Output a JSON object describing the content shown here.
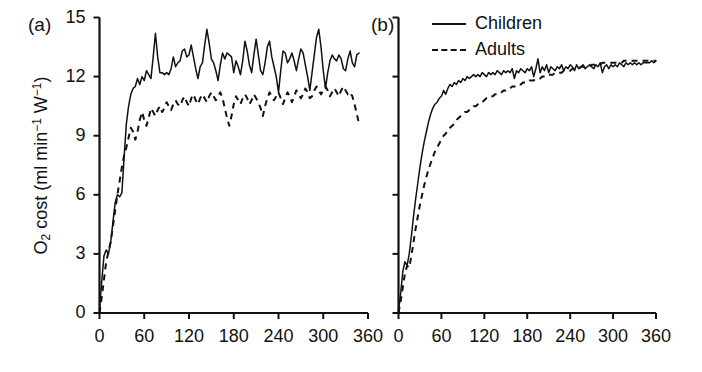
{
  "figure": {
    "ylabel_parts": {
      "lead": "O",
      "sub": "2",
      "mid": " cost (ml min",
      "sup1": "−1",
      "mid2": " W",
      "sup2": "−1",
      "tail": ")"
    },
    "ylabel_plain": "O2 cost (ml min-1 W-1)"
  },
  "panels": {
    "a": {
      "label": "(a)"
    },
    "b": {
      "label": "(b)"
    }
  },
  "legend": {
    "position": "top-right of panel b",
    "items": [
      {
        "label": "Children",
        "style": "solid",
        "swatch": "solid-line-swatch"
      },
      {
        "label": "Adults",
        "style": "dashed",
        "swatch": "dashed-line-swatch"
      }
    ]
  },
  "chart_data": [
    {
      "id": "panel-a",
      "type": "line",
      "title": "(a)",
      "xlabel": "",
      "ylabel": "O2 cost (ml min-1 W-1)",
      "xlim": [
        0,
        360
      ],
      "ylim": [
        0,
        15
      ],
      "xticks": [
        0,
        60,
        120,
        180,
        240,
        300,
        360
      ],
      "yticks": [
        0,
        3,
        6,
        9,
        12,
        15
      ],
      "xticklabels": [
        "0",
        "60",
        "120",
        "180",
        "240",
        "300",
        "360"
      ],
      "yticklabels": [
        "0",
        "3",
        "6",
        "9",
        "12",
        "15"
      ],
      "grid": false,
      "legend": false,
      "series": [
        {
          "name": "Children",
          "style": "solid",
          "x": [
            0,
            3,
            6,
            9,
            12,
            15,
            18,
            21,
            24,
            27,
            30,
            33,
            36,
            39,
            42,
            45,
            48,
            51,
            54,
            57,
            60,
            63,
            66,
            69,
            72,
            75,
            78,
            81,
            84,
            87,
            90,
            93,
            96,
            99,
            102,
            105,
            108,
            111,
            114,
            117,
            120,
            123,
            126,
            129,
            132,
            135,
            138,
            141,
            144,
            147,
            150,
            153,
            156,
            159,
            162,
            165,
            168,
            171,
            174,
            177,
            180,
            183,
            186,
            189,
            192,
            195,
            198,
            201,
            204,
            207,
            210,
            213,
            216,
            219,
            222,
            225,
            228,
            231,
            234,
            237,
            240,
            243,
            246,
            249,
            252,
            255,
            258,
            261,
            264,
            267,
            270,
            273,
            276,
            279,
            282,
            285,
            288,
            291,
            294,
            297,
            300,
            303,
            306,
            309,
            312,
            315,
            318,
            321,
            324,
            327,
            330,
            333,
            336,
            339,
            342,
            345,
            348
          ],
          "y": [
            0.2,
            1.6,
            2.9,
            3.2,
            3.0,
            3.6,
            4.6,
            5.6,
            6.0,
            5.9,
            6.1,
            7.9,
            9.6,
            10.5,
            11.1,
            11.4,
            11.5,
            11.9,
            11.6,
            12.0,
            11.8,
            12.3,
            12.1,
            11.9,
            13.0,
            14.2,
            13.0,
            12.2,
            12.2,
            12.1,
            12.2,
            12.1,
            12.4,
            13.0,
            12.5,
            12.7,
            12.8,
            13.3,
            13.4,
            13.0,
            13.1,
            13.6,
            13.0,
            12.4,
            11.9,
            12.5,
            12.7,
            13.6,
            14.4,
            13.7,
            12.9,
            12.7,
            12.3,
            11.8,
            12.6,
            13.2,
            12.9,
            13.2,
            13.1,
            13.0,
            12.2,
            12.8,
            12.5,
            12.1,
            12.8,
            13.8,
            13.3,
            12.6,
            12.2,
            13.1,
            13.9,
            13.1,
            12.3,
            12.1,
            12.7,
            13.5,
            13.8,
            13.0,
            12.5,
            12.0,
            11.2,
            12.3,
            13.3,
            13.2,
            12.7,
            12.9,
            13.2,
            12.8,
            12.3,
            12.9,
            13.4,
            13.2,
            12.6,
            12.0,
            11.3,
            12.2,
            13.1,
            14.0,
            14.4,
            13.5,
            12.3,
            11.4,
            12.2,
            12.8,
            13.1,
            12.9,
            12.8,
            13.1,
            12.9,
            12.4,
            12.3,
            12.9,
            13.3,
            12.7,
            12.5,
            13.1,
            13.2
          ]
        },
        {
          "name": "Adults",
          "style": "dashed",
          "x": [
            0,
            3,
            6,
            9,
            12,
            15,
            18,
            21,
            24,
            27,
            30,
            33,
            36,
            39,
            42,
            45,
            48,
            51,
            54,
            57,
            60,
            63,
            66,
            69,
            72,
            75,
            78,
            81,
            84,
            87,
            90,
            93,
            96,
            99,
            102,
            105,
            108,
            111,
            114,
            117,
            120,
            123,
            126,
            129,
            132,
            135,
            138,
            141,
            144,
            147,
            150,
            153,
            156,
            159,
            162,
            165,
            168,
            171,
            174,
            177,
            180,
            183,
            186,
            189,
            192,
            195,
            198,
            201,
            204,
            207,
            210,
            213,
            216,
            219,
            222,
            225,
            228,
            231,
            234,
            237,
            240,
            243,
            246,
            249,
            252,
            255,
            258,
            261,
            264,
            267,
            270,
            273,
            276,
            279,
            282,
            285,
            288,
            291,
            294,
            297,
            300,
            303,
            306,
            309,
            312,
            315,
            318,
            321,
            324,
            327,
            330,
            333,
            336,
            339,
            342,
            345,
            348
          ],
          "y": [
            0.0,
            0.8,
            1.7,
            2.6,
            3.1,
            3.6,
            4.4,
            5.2,
            6.0,
            6.7,
            7.4,
            8.0,
            8.4,
            8.9,
            9.4,
            9.2,
            8.8,
            9.2,
            9.8,
            10.2,
            9.8,
            9.5,
            9.9,
            10.4,
            10.2,
            10.0,
            10.3,
            10.5,
            10.2,
            10.4,
            10.7,
            10.5,
            10.3,
            10.6,
            10.8,
            10.6,
            10.5,
            10.8,
            11.0,
            10.7,
            10.5,
            10.9,
            11.1,
            10.8,
            10.6,
            10.9,
            11.1,
            10.9,
            10.7,
            11.0,
            11.2,
            11.0,
            10.8,
            11.0,
            11.2,
            10.9,
            10.4,
            9.9,
            9.5,
            10.0,
            10.6,
            11.0,
            10.8,
            10.6,
            10.9,
            11.1,
            10.9,
            10.6,
            10.8,
            11.1,
            10.9,
            10.7,
            10.4,
            10.0,
            10.5,
            10.9,
            11.2,
            11.0,
            10.8,
            11.0,
            11.2,
            10.9,
            10.6,
            10.9,
            11.2,
            11.0,
            10.7,
            11.0,
            11.3,
            11.1,
            10.9,
            11.1,
            11.4,
            11.2,
            10.9,
            11.0,
            11.3,
            11.5,
            11.3,
            11.1,
            11.3,
            11.5,
            11.3,
            11.0,
            11.2,
            11.4,
            11.2,
            11.0,
            11.3,
            11.5,
            11.3,
            11.1,
            11.2,
            11.0,
            10.6,
            10.1,
            9.6
          ]
        }
      ]
    },
    {
      "id": "panel-b",
      "type": "line",
      "title": "(b)",
      "xlabel": "",
      "ylabel": "O2 cost (ml min-1 W-1)",
      "xlim": [
        0,
        360
      ],
      "ylim": [
        0,
        15
      ],
      "xticks": [
        0,
        60,
        120,
        180,
        240,
        300,
        360
      ],
      "yticks": [
        0,
        3,
        6,
        9,
        12,
        15
      ],
      "xticklabels": [
        "0",
        "60",
        "120",
        "180",
        "240",
        "300",
        "360"
      ],
      "yticklabels": [],
      "grid": false,
      "legend": true,
      "series": [
        {
          "name": "Children",
          "style": "solid",
          "x": [
            0,
            3,
            6,
            9,
            12,
            15,
            18,
            21,
            24,
            27,
            30,
            33,
            36,
            39,
            42,
            45,
            48,
            51,
            54,
            57,
            60,
            63,
            66,
            69,
            72,
            75,
            78,
            81,
            84,
            87,
            90,
            93,
            96,
            99,
            102,
            105,
            108,
            111,
            114,
            117,
            120,
            123,
            126,
            129,
            132,
            135,
            138,
            141,
            144,
            147,
            150,
            153,
            156,
            159,
            162,
            165,
            168,
            171,
            174,
            177,
            180,
            183,
            186,
            189,
            192,
            195,
            198,
            201,
            204,
            207,
            210,
            213,
            216,
            219,
            222,
            225,
            228,
            231,
            234,
            237,
            240,
            243,
            246,
            249,
            252,
            255,
            258,
            261,
            264,
            267,
            270,
            273,
            276,
            279,
            282,
            285,
            288,
            291,
            294,
            297,
            300,
            303,
            306,
            309,
            312,
            315,
            318,
            321,
            324,
            327,
            330,
            333,
            336,
            339,
            342,
            345,
            348,
            351,
            354,
            357,
            360
          ],
          "y": [
            0.1,
            1.0,
            2.1,
            2.6,
            2.4,
            3.0,
            3.9,
            4.9,
            5.8,
            6.6,
            7.4,
            8.1,
            8.7,
            9.2,
            9.7,
            10.1,
            10.4,
            10.6,
            10.7,
            10.9,
            11.0,
            11.3,
            11.1,
            11.4,
            11.6,
            11.5,
            11.7,
            11.6,
            11.8,
            11.7,
            11.9,
            11.8,
            12.0,
            11.9,
            12.0,
            12.1,
            12.0,
            12.1,
            12.0,
            12.2,
            12.1,
            12.0,
            12.2,
            12.1,
            12.2,
            12.1,
            12.3,
            12.2,
            12.1,
            12.3,
            12.2,
            12.3,
            12.2,
            12.4,
            11.9,
            12.3,
            12.2,
            12.4,
            12.3,
            12.2,
            12.4,
            12.3,
            12.5,
            12.0,
            12.4,
            12.9,
            12.2,
            12.5,
            12.3,
            12.6,
            12.2,
            12.5,
            12.4,
            12.3,
            12.5,
            12.4,
            12.6,
            12.3,
            12.5,
            12.4,
            12.6,
            12.5,
            12.3,
            12.6,
            12.4,
            12.5,
            12.6,
            12.4,
            12.5,
            12.6,
            12.5,
            12.4,
            12.6,
            12.5,
            12.7,
            12.2,
            12.5,
            12.6,
            12.4,
            12.6,
            12.5,
            12.6,
            12.5,
            12.7,
            12.6,
            12.5,
            12.7,
            12.6,
            12.7,
            12.6,
            12.7,
            12.6,
            12.7,
            12.6,
            12.7,
            12.7,
            12.7,
            12.7,
            12.8,
            12.7,
            12.8
          ]
        },
        {
          "name": "Adults",
          "style": "dashed",
          "x": [
            0,
            3,
            6,
            9,
            12,
            15,
            18,
            21,
            24,
            27,
            30,
            33,
            36,
            39,
            42,
            45,
            48,
            51,
            54,
            57,
            60,
            63,
            66,
            69,
            72,
            75,
            78,
            81,
            84,
            87,
            90,
            93,
            96,
            99,
            102,
            105,
            108,
            111,
            114,
            117,
            120,
            123,
            126,
            129,
            132,
            135,
            138,
            141,
            144,
            147,
            150,
            153,
            156,
            159,
            162,
            165,
            168,
            171,
            174,
            177,
            180,
            183,
            186,
            189,
            192,
            195,
            198,
            201,
            204,
            207,
            210,
            213,
            216,
            219,
            222,
            225,
            228,
            231,
            234,
            237,
            240,
            243,
            246,
            249,
            252,
            255,
            258,
            261,
            264,
            267,
            270,
            273,
            276,
            279,
            282,
            285,
            288,
            291,
            294,
            297,
            300,
            303,
            306,
            309,
            312,
            315,
            318,
            321,
            324,
            327,
            330,
            333,
            336,
            339,
            342,
            345,
            348,
            351,
            354,
            357,
            360
          ],
          "y": [
            0.0,
            0.6,
            1.3,
            2.0,
            2.4,
            2.3,
            2.9,
            3.6,
            4.3,
            4.9,
            5.5,
            6.0,
            6.5,
            6.9,
            7.3,
            7.6,
            7.9,
            8.2,
            8.4,
            8.6,
            8.8,
            9.0,
            9.1,
            9.3,
            9.4,
            9.5,
            9.6,
            9.8,
            9.9,
            10.0,
            10.1,
            10.2,
            10.2,
            10.3,
            10.4,
            10.5,
            10.5,
            10.6,
            10.7,
            10.7,
            10.8,
            10.9,
            10.9,
            11.0,
            11.0,
            11.1,
            11.1,
            11.2,
            11.2,
            11.3,
            11.3,
            11.4,
            11.4,
            11.5,
            11.5,
            11.5,
            11.6,
            11.6,
            11.7,
            11.7,
            11.7,
            11.8,
            11.8,
            11.8,
            11.9,
            11.9,
            11.9,
            12.0,
            12.0,
            12.0,
            12.1,
            12.1,
            12.1,
            12.2,
            12.2,
            12.2,
            12.2,
            12.3,
            12.3,
            12.3,
            12.3,
            12.4,
            12.4,
            12.4,
            12.4,
            12.5,
            12.5,
            12.5,
            12.5,
            12.5,
            12.6,
            12.6,
            12.6,
            12.6,
            12.6,
            12.7,
            12.7,
            12.7,
            12.7,
            12.7,
            12.7,
            12.7,
            12.7,
            12.7,
            12.7,
            12.8,
            12.8,
            12.8,
            12.8,
            12.8,
            12.8,
            12.8,
            12.8,
            12.8,
            12.8,
            12.8,
            12.8,
            12.8,
            12.8,
            12.8,
            12.8
          ]
        }
      ]
    }
  ]
}
